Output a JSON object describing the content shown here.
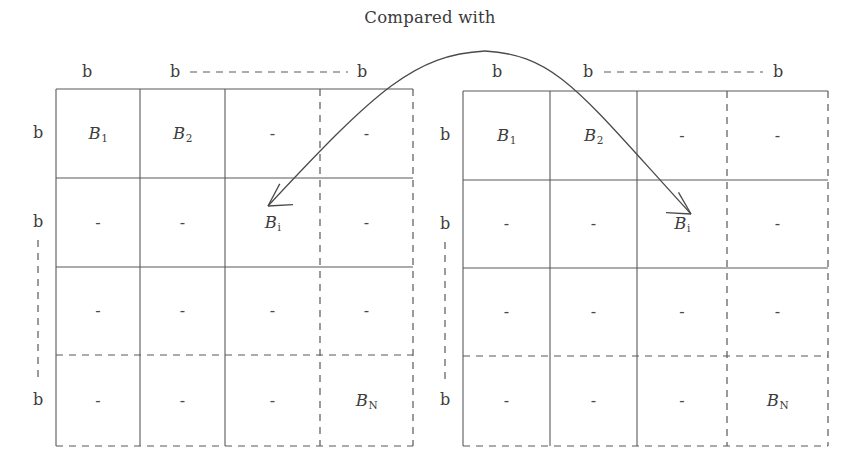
{
  "figure": {
    "caption": "Compared with",
    "type": "block-partition-comparison-diagram",
    "dash_mark": "-"
  },
  "grids": [
    {
      "id": "left-grid",
      "name": "left-block-matrix",
      "geometry": {
        "x": 56,
        "y": 89,
        "width": 357,
        "height": 357
      },
      "col_edges": [
        56,
        140,
        225,
        320,
        413
      ],
      "row_edges": [
        89,
        178,
        267,
        355,
        446
      ],
      "col_edge_styles": [
        "solid",
        "solid",
        "solid",
        "dashed",
        "dashed"
      ],
      "row_edge_styles": [
        "solid",
        "solid",
        "solid",
        "dashed",
        "dashed"
      ],
      "top_labels": [
        {
          "text": "b",
          "x": 87
        },
        {
          "text": "b",
          "x": 175
        },
        {
          "text": "b",
          "x": 362
        }
      ],
      "top_label_y": 72,
      "top_dash_connector": {
        "x1": 190,
        "x2": 348,
        "y": 72
      },
      "side_labels": [
        {
          "text": "b",
          "y": 133
        },
        {
          "text": "b",
          "y": 222
        },
        {
          "text": "b",
          "y": 400
        }
      ],
      "side_label_x": 38,
      "side_dash_connector": {
        "y1": 240,
        "y2": 382,
        "x": 38
      },
      "cells": [
        [
          "B1",
          "B2",
          "-",
          "-"
        ],
        [
          "-",
          "-",
          "Bi",
          "-"
        ],
        [
          "-",
          "-",
          "-",
          "-"
        ],
        [
          "-",
          "-",
          "-",
          "BN"
        ]
      ]
    },
    {
      "id": "right-grid",
      "name": "right-block-matrix",
      "geometry": {
        "x": 463,
        "y": 91,
        "width": 365,
        "height": 355
      },
      "col_edges": [
        463,
        550,
        637,
        727,
        828
      ],
      "row_edges": [
        91,
        180,
        268,
        356,
        446
      ],
      "col_edge_styles": [
        "solid",
        "solid",
        "solid",
        "dashed",
        "dashed"
      ],
      "row_edge_styles": [
        "solid",
        "solid",
        "solid",
        "dashed",
        "dashed"
      ],
      "top_labels": [
        {
          "text": "b",
          "x": 497,
          "y": 72
        },
        {
          "text": "b",
          "x": 588,
          "y": 72
        },
        {
          "text": "b",
          "x": 778,
          "y": 72
        }
      ],
      "top_label_y": 72,
      "top_dash_connector": {
        "x1": 604,
        "x2": 763,
        "y": 72
      },
      "side_labels": [
        {
          "text": "b",
          "y": 135
        },
        {
          "text": "b",
          "y": 224
        },
        {
          "text": "b",
          "y": 400
        }
      ],
      "side_label_x": 445,
      "side_dash_connector": {
        "y1": 242,
        "y2": 382,
        "x": 445
      },
      "cells": [
        [
          "B1",
          "B2",
          "-",
          "-"
        ],
        [
          "-",
          "-",
          "Bi",
          "-"
        ],
        [
          "-",
          "-",
          "-",
          "-"
        ],
        [
          "-",
          "-",
          "-",
          "BN"
        ]
      ]
    }
  ],
  "cell_label_text": {
    "B1": "B",
    "B1_sub": "1",
    "B2": "B",
    "B2_sub": "2",
    "Bi": "B",
    "Bi_sub": "i",
    "BN": "B",
    "BN_sub": "N",
    "dash": "-"
  },
  "arrow": {
    "name": "double-headed-comparison-arc",
    "description": "curved double arrow linking the Bi cell of the left matrix with the Bi cell of the right matrix",
    "peak": {
      "x": 485,
      "y": 51
    },
    "left_tip": {
      "x": 268,
      "y": 206
    },
    "right_tip": {
      "x": 691,
      "y": 214
    },
    "color": "#4a4a4a"
  },
  "style": {
    "line_color": "#595959",
    "text_color": "#3d3d3d",
    "background": "#ffffff"
  }
}
